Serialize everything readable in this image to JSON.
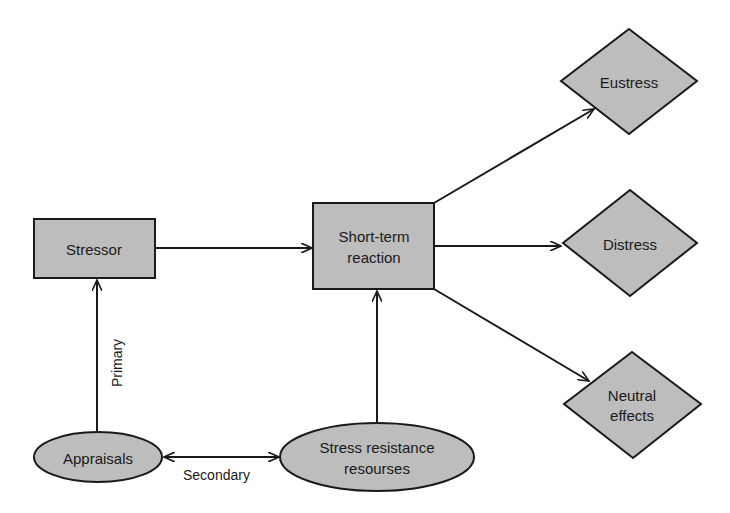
{
  "diagram": {
    "type": "flowchart",
    "colors": {
      "node_fill": "#bdbdbd",
      "stroke": "#1a1a1a",
      "background": "#ffffff",
      "text": "#1a1a1a"
    },
    "nodes": {
      "stressor": {
        "label": "Stressor",
        "shape": "rectangle"
      },
      "short_term_reaction": {
        "line1": "Short-term",
        "line2": "reaction",
        "shape": "rectangle"
      },
      "eustress": {
        "label": "Eustress",
        "shape": "diamond"
      },
      "distress": {
        "label": "Distress",
        "shape": "diamond"
      },
      "neutral_effects": {
        "line1": "Neutral",
        "line2": "effects",
        "shape": "diamond"
      },
      "appraisals": {
        "label": "Appraisals",
        "shape": "ellipse"
      },
      "stress_resistance_resources": {
        "line1": "Stress resistance",
        "line2": "resourses",
        "shape": "ellipse"
      }
    },
    "edges": [
      {
        "from": "stressor",
        "to": "short_term_reaction",
        "label": ""
      },
      {
        "from": "appraisals",
        "to": "stressor",
        "label": "Primary"
      },
      {
        "from": "appraisals",
        "to": "stress_resistance_resources",
        "label": "Secondary",
        "bidirectional": true
      },
      {
        "from": "stress_resistance_resources",
        "to": "short_term_reaction",
        "label": ""
      },
      {
        "from": "short_term_reaction",
        "to": "eustress",
        "label": ""
      },
      {
        "from": "short_term_reaction",
        "to": "distress",
        "label": ""
      },
      {
        "from": "short_term_reaction",
        "to": "neutral_effects",
        "label": ""
      }
    ],
    "edge_labels": {
      "primary": "Primary",
      "secondary": "Secondary"
    }
  }
}
